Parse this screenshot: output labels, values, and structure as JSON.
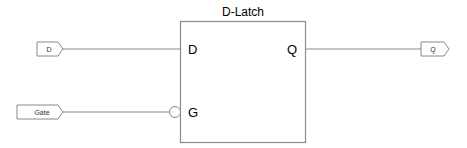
{
  "diagram": {
    "title": "D-Latch",
    "block": {
      "pins_left": [
        {
          "label": "D",
          "inverted": false
        },
        {
          "label": "G",
          "inverted": true
        }
      ],
      "pins_right": [
        {
          "label": "Q",
          "inverted": false
        }
      ]
    },
    "ports": {
      "inputs": [
        {
          "label": "D",
          "direction": "input"
        },
        {
          "label": "Gate",
          "direction": "input"
        }
      ],
      "outputs": [
        {
          "label": "Q",
          "direction": "output"
        }
      ]
    },
    "colors": {
      "line": "#8a8a8a",
      "text": "#000000",
      "background": "#ffffff"
    }
  }
}
